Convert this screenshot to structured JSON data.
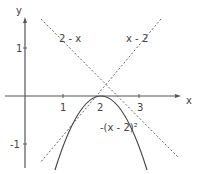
{
  "diagram": {
    "type": "function-graph",
    "axes": {
      "x_label": "x",
      "y_label": "y"
    },
    "x_ticks": [
      "1",
      "2",
      "3"
    ],
    "y_ticks": [
      "1",
      "-1"
    ],
    "curves": [
      {
        "label": "2 - x",
        "style": "dashed"
      },
      {
        "label": "x - 2",
        "style": "dashed"
      },
      {
        "label": "-(x - 2)²",
        "style": "solid"
      }
    ]
  }
}
